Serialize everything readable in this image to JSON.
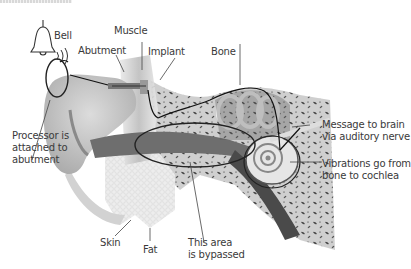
{
  "diagram": {
    "labels": {
      "bell": "Bell",
      "muscle": "Muscle",
      "abutment": "Abutment",
      "implant": "Implant",
      "bone": "Bone",
      "processor": "Processor is\nattached to\nabutment",
      "message": "Message to brain\nvia auditory nerve",
      "vibrations": "Vibrations go from\nbone to cochlea",
      "skin": "Skin",
      "fat": "Fat",
      "bypassed": "This area\nis bypassed"
    },
    "colors": {
      "line": "#3a3a3a",
      "bone": "#b9b9b9",
      "bone_dark": "#5a5a5a",
      "canal": "#6e6e6e",
      "skin": "#e4e4e4",
      "fat": "#ececec"
    }
  }
}
